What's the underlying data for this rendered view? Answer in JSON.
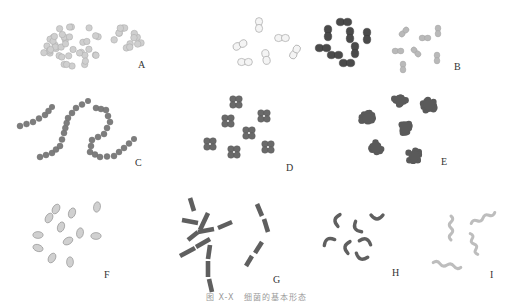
{
  "figure": {
    "caption": {
      "number": "图 X-X",
      "title": "细菌的基本形态"
    },
    "colors": {
      "pale": "#cfcfcf",
      "pale_stroke": "#a8a8a8",
      "dark": "#4a4a4a",
      "mid": "#6a6a6a",
      "light_gray": "#b9b9b9",
      "label": "#333333"
    },
    "panels": [
      {
        "id": "A",
        "label": "A",
        "label_pos": [
          138,
          68
        ],
        "kind": "single-cocci",
        "clusters": [
          {
            "cx": 70,
            "cy": 45,
            "count": 42,
            "spread": 28,
            "r": 3.2
          },
          {
            "cx": 128,
            "cy": 37,
            "count": 14,
            "spread": 14,
            "r": 3.3
          }
        ]
      },
      {
        "id": "diplo-outline",
        "label": "",
        "kind": "diplo-outline",
        "items": [
          {
            "x": 259,
            "y": 25,
            "angle": 90
          },
          {
            "x": 282,
            "y": 38,
            "angle": 0
          },
          {
            "x": 240,
            "y": 45,
            "angle": -25
          },
          {
            "x": 266,
            "y": 57,
            "angle": 80
          },
          {
            "x": 245,
            "y": 62,
            "angle": 0
          },
          {
            "x": 295,
            "y": 52,
            "angle": -60
          }
        ]
      },
      {
        "id": "B-dark",
        "label": "",
        "kind": "diplo-dark",
        "items": [
          {
            "x": 344,
            "y": 22,
            "angle": 0
          },
          {
            "x": 328,
            "y": 33,
            "angle": 90
          },
          {
            "x": 350,
            "y": 35,
            "angle": 90
          },
          {
            "x": 367,
            "y": 36,
            "angle": 90
          },
          {
            "x": 323,
            "y": 48,
            "angle": 0
          },
          {
            "x": 355,
            "y": 50,
            "angle": 90
          },
          {
            "x": 335,
            "y": 55,
            "angle": 0
          },
          {
            "x": 347,
            "y": 63,
            "angle": 0
          }
        ]
      },
      {
        "id": "B",
        "label": "B",
        "label_pos": [
          454,
          70
        ],
        "kind": "diplo-light",
        "items": [
          {
            "x": 404,
            "y": 32,
            "angle": -45
          },
          {
            "x": 425,
            "y": 38,
            "angle": 0
          },
          {
            "x": 438,
            "y": 31,
            "angle": 90
          },
          {
            "x": 398,
            "y": 51,
            "angle": 0
          },
          {
            "x": 416,
            "y": 52,
            "angle": 45
          },
          {
            "x": 437,
            "y": 58,
            "angle": 90
          },
          {
            "x": 403,
            "y": 67,
            "angle": 90
          }
        ]
      },
      {
        "id": "C",
        "label": "C",
        "label_pos": [
          135,
          166
        ],
        "kind": "strepto",
        "chains": [
          [
            [
              20,
              126
            ],
            [
              33,
              122
            ],
            [
              45,
              115
            ],
            [
              52,
              107
            ]
          ],
          [
            [
              40,
              157
            ],
            [
              52,
              153
            ],
            [
              60,
              146
            ],
            [
              64,
              133
            ],
            [
              68,
              118
            ],
            [
              76,
              108
            ],
            [
              88,
              101
            ]
          ],
          [
            [
              96,
              108
            ],
            [
              106,
              110
            ],
            [
              110,
              122
            ],
            [
              104,
              134
            ],
            [
              92,
              140
            ],
            [
              90,
              152
            ],
            [
              100,
              157
            ],
            [
              114,
              156
            ],
            [
              124,
              148
            ],
            [
              134,
              139
            ]
          ]
        ],
        "r": 3
      },
      {
        "id": "D",
        "label": "D",
        "label_pos": [
          286,
          171
        ],
        "kind": "tetrad",
        "items": [
          {
            "x": 236,
            "y": 102
          },
          {
            "x": 264,
            "y": 116
          },
          {
            "x": 228,
            "y": 121
          },
          {
            "x": 249,
            "y": 133
          },
          {
            "x": 210,
            "y": 144
          },
          {
            "x": 234,
            "y": 152
          },
          {
            "x": 268,
            "y": 147
          }
        ]
      },
      {
        "id": "E",
        "label": "E",
        "label_pos": [
          441,
          165
        ],
        "kind": "sarcina",
        "items": [
          {
            "x": 400,
            "y": 100
          },
          {
            "x": 429,
            "y": 105
          },
          {
            "x": 368,
            "y": 119
          },
          {
            "x": 405,
            "y": 127
          },
          {
            "x": 376,
            "y": 147
          },
          {
            "x": 414,
            "y": 156
          }
        ]
      },
      {
        "id": "F",
        "label": "F",
        "label_pos": [
          104,
          278
        ],
        "kind": "coccobacilli",
        "items": [
          {
            "x": 56,
            "y": 209,
            "angle": -60
          },
          {
            "x": 49,
            "y": 218,
            "angle": -60
          },
          {
            "x": 72,
            "y": 213,
            "angle": -70
          },
          {
            "x": 97,
            "y": 207,
            "angle": -80
          },
          {
            "x": 61,
            "y": 227,
            "angle": -70
          },
          {
            "x": 38,
            "y": 235,
            "angle": 0
          },
          {
            "x": 80,
            "y": 233,
            "angle": -80
          },
          {
            "x": 68,
            "y": 241,
            "angle": -30
          },
          {
            "x": 96,
            "y": 236,
            "angle": 0
          },
          {
            "x": 38,
            "y": 248,
            "angle": 20
          },
          {
            "x": 52,
            "y": 258,
            "angle": -60
          },
          {
            "x": 70,
            "y": 262,
            "angle": 90
          }
        ]
      },
      {
        "id": "G",
        "label": "G",
        "label_pos": [
          273,
          283
        ],
        "kind": "bacilli-chain",
        "rods": [
          [
            190,
            198,
            194,
            211
          ],
          [
            182,
            220,
            198,
            223
          ],
          [
            208,
            213,
            200,
            230
          ],
          [
            198,
            232,
            188,
            240
          ],
          [
            198,
            232,
            214,
            229
          ],
          [
            218,
            228,
            232,
            222
          ],
          [
            210,
            239,
            196,
            247
          ],
          [
            195,
            248,
            180,
            256
          ],
          [
            210,
            245,
            208,
            259
          ],
          [
            208,
            261,
            208,
            277
          ],
          [
            209,
            279,
            212,
            292
          ],
          [
            257,
            204,
            262,
            216
          ],
          [
            264,
            219,
            268,
            232
          ],
          [
            262,
            242,
            255,
            253
          ],
          [
            252,
            256,
            246,
            266
          ]
        ]
      },
      {
        "id": "H",
        "label": "H",
        "label_pos": [
          392,
          276
        ],
        "kind": "vibrio",
        "items": [
          {
            "x": 336,
            "y": 220,
            "angle": 100
          },
          {
            "x": 356,
            "y": 228,
            "angle": 60
          },
          {
            "x": 377,
            "y": 218,
            "angle": 0
          },
          {
            "x": 328,
            "y": 240,
            "angle": 150
          },
          {
            "x": 346,
            "y": 247,
            "angle": 100
          },
          {
            "x": 366,
            "y": 240,
            "angle": 200
          },
          {
            "x": 361,
            "y": 258,
            "angle": 20
          }
        ]
      },
      {
        "id": "I",
        "label": "I",
        "label_pos": [
          490,
          278
        ],
        "kind": "spirochete",
        "items": [
          {
            "x": 451,
            "y": 228,
            "angle": 90,
            "len": 24
          },
          {
            "x": 483,
            "y": 218,
            "angle": -25,
            "len": 26
          },
          {
            "x": 474,
            "y": 244,
            "angle": 70,
            "len": 22
          },
          {
            "x": 447,
            "y": 265,
            "angle": 10,
            "len": 28
          }
        ]
      }
    ]
  }
}
